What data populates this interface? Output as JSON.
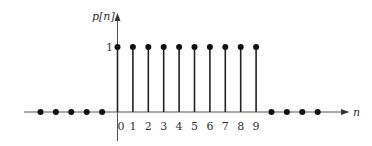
{
  "chart_data": {
    "type": "stem",
    "title": "",
    "ylabel": "p[n]",
    "xlabel": "n",
    "y_tick_labels": [
      "1"
    ],
    "x_tick_labels": [
      "0",
      "1",
      "2",
      "3",
      "4",
      "5",
      "6",
      "7",
      "8",
      "9"
    ],
    "x": [
      -5,
      -4,
      -3,
      -2,
      -1,
      0,
      1,
      2,
      3,
      4,
      5,
      6,
      7,
      8,
      9,
      10,
      11,
      12,
      13
    ],
    "values": [
      0,
      0,
      0,
      0,
      0,
      1,
      1,
      1,
      1,
      1,
      1,
      1,
      1,
      1,
      1,
      0,
      0,
      0,
      0
    ],
    "ylim": [
      0,
      1
    ],
    "grid": false,
    "legend": null
  },
  "labels": {
    "y_axis": "p[n]",
    "x_axis": "n",
    "unit_level": "1"
  }
}
